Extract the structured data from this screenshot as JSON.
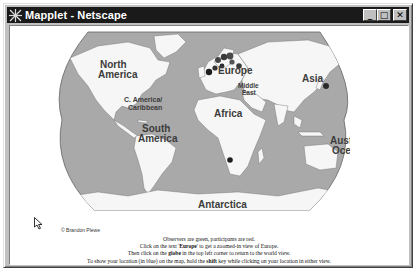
{
  "window": {
    "title": "Mapplet - Netscape",
    "buttons": {
      "minimize": "_",
      "maximize": "□",
      "close": "✕"
    }
  },
  "map": {
    "colors": {
      "ocean": "#a9a9a9",
      "land": "#f6f6f6",
      "border": "#6a6a6a",
      "observer": "#4a4a4a",
      "participant": "#1e1e1e",
      "label": "#3c3c3c"
    },
    "region_labels": {
      "north_america": [
        "North",
        "America"
      ],
      "central_america": [
        "C. America/",
        "Caribbean"
      ],
      "south_america": [
        "South",
        "America"
      ],
      "europe": "Europe",
      "middle_east": [
        "Middle",
        "East"
      ],
      "africa": "Africa",
      "asia": "Asia",
      "australia": [
        "Australia/",
        "Oceania"
      ],
      "antarctica": "Antarctica"
    },
    "credit": "© Brandon Plewe"
  },
  "instructions": {
    "line1": "Observers are green, participants are red.",
    "line2_pre": "Click on the text '",
    "line2_link": "Europe",
    "line2_post": "' to get a zoomed-in view of Europe.",
    "line3_pre": "Then click on the ",
    "line3_bold": "globe",
    "line3_post": " in the top left corner to return to the world view.",
    "line4_pre": "To show your location (in blue) on the map, hold the ",
    "line4_bold": "shift",
    "line4_post": " key while clicking on your location in either view."
  }
}
